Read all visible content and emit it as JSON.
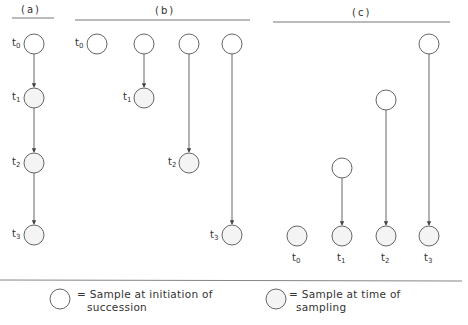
{
  "colors": {
    "stroke": "#555555",
    "text": "#333333",
    "initiation_fill": "#ffffff",
    "sampling_fill": "#f4f4f4"
  },
  "panels": {
    "a": {
      "label": "(a)",
      "nodes": [
        {
          "time": "t",
          "sub": "0",
          "type": "initiation"
        },
        {
          "time": "t",
          "sub": "1",
          "type": "sampling"
        },
        {
          "time": "t",
          "sub": "2",
          "type": "sampling"
        },
        {
          "time": "t",
          "sub": "3",
          "type": "sampling"
        }
      ]
    },
    "b": {
      "label": "(b)",
      "series": [
        {
          "bottom_label": "t",
          "sub": "0"
        },
        {
          "bottom_label": "t",
          "sub": "1"
        },
        {
          "bottom_label": "t",
          "sub": "2"
        },
        {
          "bottom_label": "t",
          "sub": "3"
        }
      ]
    },
    "c": {
      "label": "(c)",
      "series": [
        {
          "bottom_label": "t",
          "sub": "0"
        },
        {
          "bottom_label": "t",
          "sub": "1"
        },
        {
          "bottom_label": "t",
          "sub": "2"
        },
        {
          "bottom_label": "t",
          "sub": "3"
        }
      ]
    }
  },
  "legend": {
    "initiation": {
      "line1": "= Sample at initiation of",
      "line2": "succession"
    },
    "sampling": {
      "line1": "= Sample at time of",
      "line2": "sampling"
    }
  }
}
